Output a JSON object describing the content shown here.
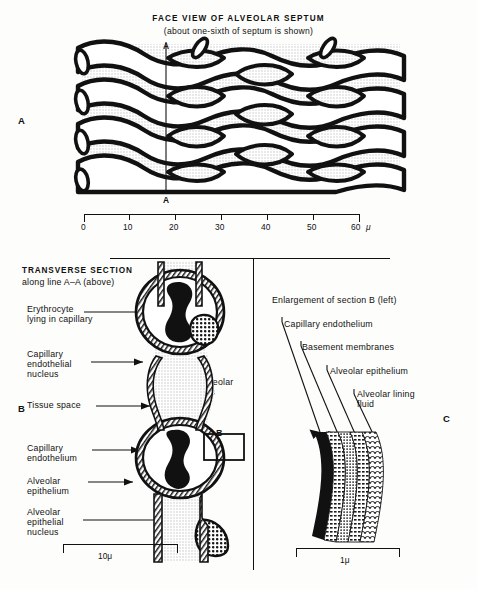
{
  "figure": {
    "panel_a": {
      "letter": "A",
      "title": "FACE VIEW OF ALVEOLAR SEPTUM",
      "subtitle": "(about one-sixth of septum is shown)",
      "section_line_top": "A",
      "section_line_bottom": "A",
      "scale": {
        "ticks": [
          "0",
          "10",
          "20",
          "30",
          "40",
          "50",
          "60"
        ],
        "unit": "μ"
      }
    },
    "panel_b": {
      "letter": "B",
      "title_line1": "TRANSVERSE SECTION",
      "title_line2": "along line A–A (above)",
      "labels": [
        "Erythrocyte\nlying in capillary",
        "Capillary\nendothelial\nnucleus",
        "Tissue space",
        "Capillary\nendothelium",
        "Alveolar\nepithelium",
        "Alveolar\nepithelial\nnucleus"
      ],
      "inline_label": "Alveolar\ngas",
      "detail_box_letter": "B",
      "scale": {
        "label": "10μ"
      }
    },
    "panel_c": {
      "letter": "C",
      "title": "Enlargement of section B (left)",
      "labels": [
        "Capillary endothelium",
        "Basement membranes",
        "Alveolar epithelium",
        "Alveolar lining\nfluid"
      ],
      "scale": {
        "label": "1μ"
      }
    },
    "colors": {
      "ink": "#111111",
      "stipple": "#d9d9d9",
      "page": "#fdfdfb"
    }
  }
}
